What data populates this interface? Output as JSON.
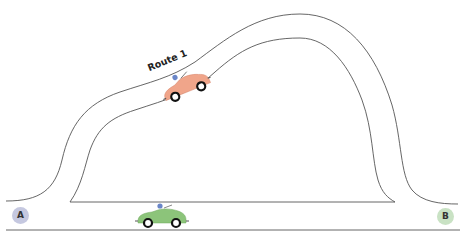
{
  "diagram": {
    "route_label": "Route 1",
    "start_node": {
      "label": "A",
      "color": "#c5c8e0"
    },
    "end_node": {
      "label": "B",
      "color": "#c9e2c4"
    },
    "cars": [
      {
        "name": "orange-car",
        "color": "#f0a58a",
        "position": "on Route 1"
      },
      {
        "name": "green-car",
        "color": "#8cc47a",
        "position": "on direct road"
      }
    ],
    "stroke_color": "#555555"
  }
}
